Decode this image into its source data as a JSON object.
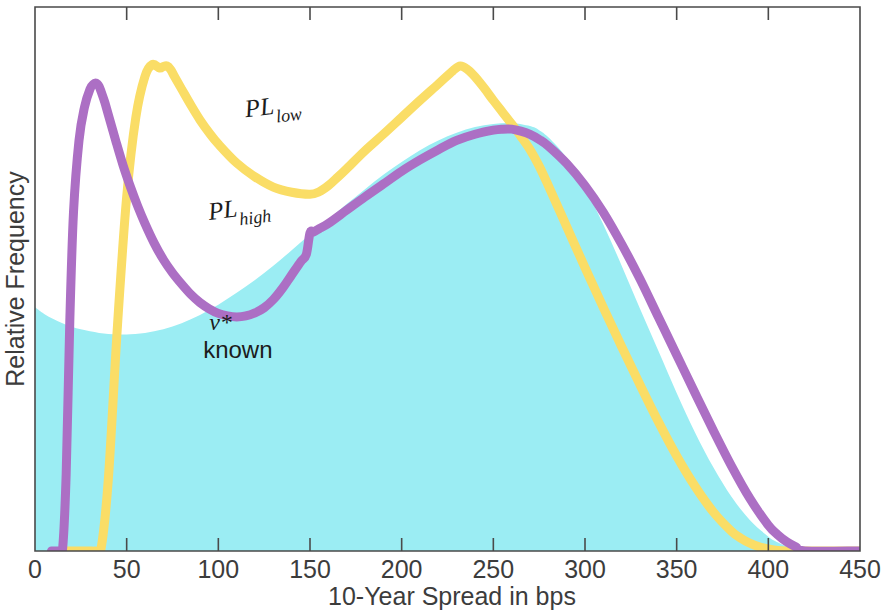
{
  "chart_data": {
    "type": "area",
    "title": "",
    "xlabel": "10-Year Spread in bps",
    "ylabel": "Relative Frequency",
    "xlim": [
      0,
      450
    ],
    "ylim": [
      0,
      1.06
    ],
    "grid": false,
    "legend_position": "inline-annotations",
    "xticks": [
      0,
      50,
      100,
      150,
      200,
      250,
      300,
      350,
      400,
      450
    ],
    "xtick_labels": [
      "0",
      "50",
      "100",
      "150",
      "200",
      "250",
      "300",
      "350",
      "400",
      "450"
    ],
    "yticks": [],
    "ytick_labels": [],
    "colors": {
      "area_fill": "#9BEDF3",
      "pl_low": "#FADD66",
      "pl_high": "#AC6FC4",
      "axis": "#4a4a4a",
      "text": "#3c3c3c"
    },
    "annotations": [
      {
        "name": "pl-low-label",
        "base": "PL",
        "sub": "low",
        "x": 115,
        "y": 0.845
      },
      {
        "name": "pl-high-label",
        "base": "PL",
        "sub": "high",
        "x": 95,
        "y": 0.645
      },
      {
        "name": "nu-star-known-label",
        "line1": "ν*",
        "line2": "known",
        "x": 95,
        "y": 0.43
      }
    ],
    "series": [
      {
        "name": "ν* known",
        "kind": "area",
        "color": "#9BEDF3",
        "x": [
          0,
          5,
          10,
          15,
          20,
          25,
          30,
          35,
          40,
          45,
          50,
          60,
          70,
          80,
          90,
          100,
          110,
          120,
          130,
          140,
          150,
          160,
          170,
          180,
          190,
          200,
          210,
          220,
          230,
          240,
          250,
          260,
          270,
          275,
          280,
          290,
          300,
          310,
          320,
          330,
          340,
          350,
          360,
          370,
          380,
          390,
          400,
          405,
          410,
          415,
          420,
          425,
          450
        ],
        "values": [
          0.475,
          0.462,
          0.452,
          0.444,
          0.437,
          0.432,
          0.428,
          0.425,
          0.423,
          0.422,
          0.422,
          0.425,
          0.432,
          0.444,
          0.46,
          0.48,
          0.503,
          0.528,
          0.556,
          0.586,
          0.617,
          0.646,
          0.676,
          0.705,
          0.733,
          0.758,
          0.781,
          0.8,
          0.815,
          0.826,
          0.832,
          0.834,
          0.828,
          0.82,
          0.806,
          0.766,
          0.708,
          0.636,
          0.556,
          0.472,
          0.39,
          0.308,
          0.231,
          0.163,
          0.105,
          0.06,
          0.028,
          0.017,
          0.009,
          0.004,
          0.0,
          0.0,
          0.0
        ]
      },
      {
        "name": "PL low",
        "kind": "line",
        "color": "#FADD66",
        "x": [
          17,
          19,
          21,
          24,
          27,
          30,
          33,
          36,
          40,
          45,
          50,
          55,
          60,
          64,
          68,
          70,
          72,
          74,
          76,
          80,
          85,
          90,
          95,
          100,
          110,
          120,
          130,
          140,
          150,
          155,
          160,
          165,
          170,
          180,
          190,
          200,
          210,
          220,
          228,
          232,
          236,
          240,
          245,
          250,
          255,
          260,
          265,
          270,
          275,
          280,
          290,
          300,
          310,
          320,
          330,
          340,
          350,
          360,
          370,
          380,
          385,
          390,
          395,
          400,
          405,
          410,
          420,
          450
        ],
        "values": [
          0.0,
          0.0,
          0.0,
          0.0,
          0.0,
          0.0,
          0.0,
          0.004,
          0.14,
          0.44,
          0.69,
          0.845,
          0.925,
          0.948,
          0.941,
          0.944,
          0.945,
          0.938,
          0.925,
          0.9,
          0.869,
          0.84,
          0.815,
          0.793,
          0.756,
          0.729,
          0.709,
          0.699,
          0.695,
          0.7,
          0.712,
          0.728,
          0.745,
          0.78,
          0.812,
          0.845,
          0.878,
          0.91,
          0.936,
          0.945,
          0.938,
          0.924,
          0.902,
          0.878,
          0.855,
          0.832,
          0.808,
          0.782,
          0.75,
          0.712,
          0.632,
          0.552,
          0.474,
          0.398,
          0.324,
          0.252,
          0.185,
          0.126,
          0.076,
          0.038,
          0.025,
          0.015,
          0.008,
          0.004,
          0.001,
          0.0,
          0.0,
          0.0
        ]
      },
      {
        "name": "PL high",
        "kind": "line",
        "color": "#AC6FC4",
        "x": [
          9,
          11,
          13,
          15,
          17,
          19,
          21,
          24,
          27,
          30,
          32,
          33,
          34,
          35,
          36,
          38,
          40,
          44,
          48,
          52,
          56,
          60,
          65,
          70,
          75,
          80,
          85,
          90,
          95,
          100,
          105,
          110,
          115,
          120,
          125,
          130,
          135,
          140,
          145,
          148,
          150,
          152,
          155,
          160,
          170,
          180,
          190,
          200,
          210,
          220,
          230,
          240,
          250,
          255,
          260,
          265,
          270,
          275,
          280,
          290,
          300,
          310,
          320,
          330,
          340,
          350,
          360,
          370,
          380,
          390,
          400,
          405,
          410,
          415,
          420,
          450
        ],
        "values": [
          0.0,
          0.0,
          0.0,
          0.002,
          0.15,
          0.45,
          0.66,
          0.8,
          0.865,
          0.9,
          0.91,
          0.912,
          0.91,
          0.905,
          0.896,
          0.875,
          0.85,
          0.8,
          0.752,
          0.71,
          0.672,
          0.638,
          0.6,
          0.568,
          0.542,
          0.52,
          0.5,
          0.484,
          0.472,
          0.463,
          0.458,
          0.456,
          0.458,
          0.464,
          0.474,
          0.49,
          0.512,
          0.538,
          0.564,
          0.578,
          0.62,
          0.622,
          0.628,
          0.638,
          0.664,
          0.69,
          0.715,
          0.74,
          0.762,
          0.782,
          0.8,
          0.812,
          0.82,
          0.822,
          0.822,
          0.818,
          0.812,
          0.802,
          0.789,
          0.755,
          0.712,
          0.66,
          0.598,
          0.53,
          0.456,
          0.382,
          0.308,
          0.235,
          0.165,
          0.102,
          0.05,
          0.032,
          0.018,
          0.008,
          0.0,
          0.0
        ]
      }
    ]
  },
  "axes": {
    "x_title": "10-Year Spread in bps",
    "y_title": "Relative Frequency"
  }
}
